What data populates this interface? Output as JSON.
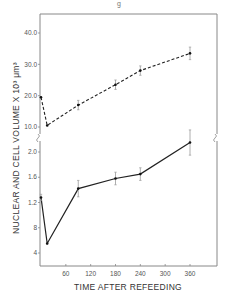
{
  "chart_data": {
    "type": "line",
    "title": "",
    "top_mark": "g",
    "xlabel": "TIME AFTER REFEEDING",
    "ylabel": "NUCLEAR AND CELL VOLUME X 10³ μm³",
    "x_ticks": [
      60,
      120,
      180,
      240,
      300,
      360
    ],
    "x_tick_labels": [
      "60",
      "120",
      "180",
      "240",
      "300",
      "360"
    ],
    "xlim": [
      0,
      420
    ],
    "upper_axis": {
      "tick_values": [
        40.0,
        30.0,
        20.0,
        10.0
      ],
      "tick_labels": [
        "40.0",
        "30.0",
        "20.0",
        "10.0"
      ],
      "ylim": [
        8,
        42
      ]
    },
    "lower_axis": {
      "tick_values": [
        2.0,
        1.6,
        1.2,
        0.8,
        0.4
      ],
      "tick_labels": [
        "2.0",
        "1.6",
        "1.2",
        "8",
        "4"
      ],
      "ylim": [
        0.2,
        2.2
      ]
    },
    "axis_break": true,
    "grid": false,
    "series": [
      {
        "name": "Cell volume",
        "axis": "upper",
        "style": "dashed",
        "x": [
          0,
          15,
          90,
          180,
          240,
          360
        ],
        "values": [
          19.5,
          10.5,
          17.0,
          23.5,
          28.0,
          33.5
        ],
        "error": [
          0,
          0,
          1.5,
          1.5,
          1.5,
          2.0
        ]
      },
      {
        "name": "Nuclear volume",
        "axis": "lower",
        "style": "solid",
        "x": [
          0,
          15,
          90,
          180,
          240,
          360
        ],
        "values": [
          1.28,
          0.55,
          1.42,
          1.58,
          1.65,
          2.15
        ],
        "error": [
          0.05,
          0,
          0.13,
          0.1,
          0.1,
          0.2
        ]
      }
    ]
  }
}
